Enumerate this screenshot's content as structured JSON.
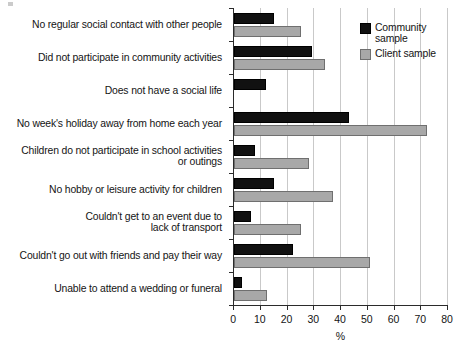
{
  "chart_data": {
    "type": "bar",
    "orientation": "horizontal",
    "title": "",
    "xlabel": "%",
    "ylabel": "",
    "xlim": [
      0,
      80
    ],
    "xticks": [
      0,
      10,
      20,
      30,
      40,
      50,
      60,
      70,
      80
    ],
    "grid": true,
    "legend_position": "upper right inside plot",
    "categories": [
      "No regular social contact with other people",
      "Did not participate in community activities",
      "Does not have a social life",
      "No week's holiday away from home each year",
      "Children do not participate in school activities\nor outings",
      "No hobby or leisure activity for children",
      "Couldn't get to an event due to\nlack of transport",
      "Couldn't go out with friends and pay their way",
      "Unable to attend a wedding or funeral"
    ],
    "series": [
      {
        "name": "Community\nsample",
        "color": "#111111",
        "values": [
          15,
          29,
          12,
          43,
          8,
          15,
          6.5,
          22,
          3
        ]
      },
      {
        "name": "Client sample",
        "color": "#a8a8a8",
        "values": [
          25,
          34,
          null,
          72,
          28,
          37,
          25,
          51,
          12.5
        ]
      }
    ]
  },
  "legend": {
    "community_label": "Community\nsample",
    "client_label": "Client sample"
  },
  "axis": {
    "x_title": "%",
    "tick_labels": [
      "0",
      "10",
      "20",
      "30",
      "40",
      "50",
      "60",
      "70",
      "80"
    ]
  }
}
